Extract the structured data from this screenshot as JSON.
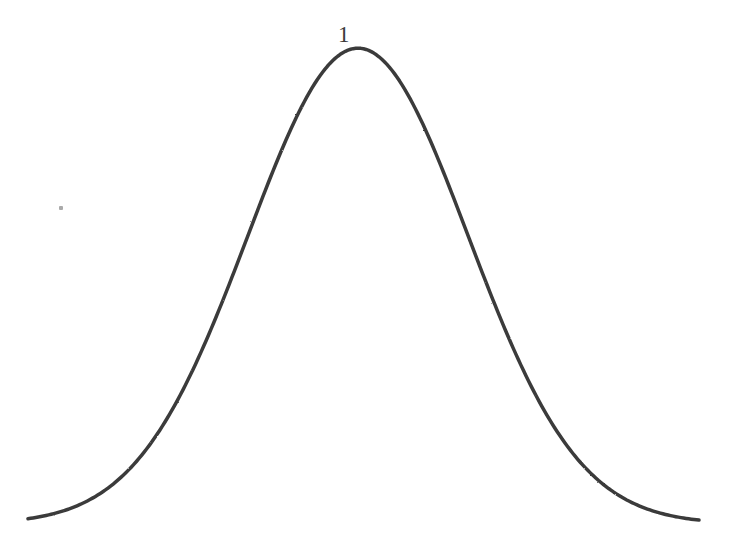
{
  "figure": {
    "type": "bell-curve-diagram",
    "background_color": "#ffffff",
    "ink_color": "#3b3b3b",
    "axis_color": "#555555",
    "peak_label": "1"
  },
  "chart_data": {
    "type": "line",
    "title": "",
    "subtitle": "",
    "xlabel": "",
    "ylabel": "",
    "legend": [],
    "legend_position": "none",
    "grid": false,
    "annotations": [
      {
        "name": "peak-height-label",
        "text": "1",
        "x": 0,
        "y": 1,
        "pixel_x": 345,
        "pixel_y": 37,
        "description": "value label marking the peak height of the curve"
      }
    ],
    "axes": {
      "x_axis_visible": true,
      "y_axis_visible": false,
      "x_axis_pixel_y": 524,
      "x_axis_pixel_x_start": 28,
      "x_axis_pixel_x_end": 712,
      "center_line_visible": true,
      "center_line_pixel_x": 358,
      "center_line_pixel_y_top": 28,
      "center_line_pixel_y_bottom": 524,
      "xlim": [
        -3.0,
        3.1
      ],
      "ylim": [
        0,
        1.05
      ],
      "x_ticks": [],
      "y_ticks": [
        1
      ]
    },
    "function": "gaussian",
    "peak_value": 1,
    "mean": 0,
    "sigma": 1,
    "x": [
      -3.0,
      -2.8,
      -2.6,
      -2.4,
      -2.2,
      -2.0,
      -1.8,
      -1.6,
      -1.4,
      -1.2,
      -1.0,
      -0.8,
      -0.6,
      -0.4,
      -0.2,
      0.0,
      0.2,
      0.4,
      0.6,
      0.8,
      1.0,
      1.2,
      1.4,
      1.6,
      1.8,
      2.0,
      2.2,
      2.4,
      2.6,
      2.8,
      3.0
    ],
    "values": [
      0.011,
      0.02,
      0.034,
      0.056,
      0.089,
      0.135,
      0.198,
      0.278,
      0.375,
      0.487,
      0.607,
      0.726,
      0.835,
      0.923,
      0.98,
      1.0,
      0.98,
      0.923,
      0.835,
      0.726,
      0.607,
      0.487,
      0.375,
      0.278,
      0.198,
      0.135,
      0.089,
      0.056,
      0.034,
      0.02,
      0.011
    ],
    "series": [
      {
        "name": "normal-distribution",
        "values": [
          0.011,
          0.02,
          0.034,
          0.056,
          0.089,
          0.135,
          0.198,
          0.278,
          0.375,
          0.487,
          0.607,
          0.726,
          0.835,
          0.923,
          0.98,
          1.0,
          0.98,
          0.923,
          0.835,
          0.726,
          0.607,
          0.487,
          0.375,
          0.278,
          0.198,
          0.135,
          0.089,
          0.056,
          0.034,
          0.02,
          0.011
        ]
      }
    ]
  },
  "artifacts": {
    "speck": {
      "name": "scan-speck",
      "pixel_x": 61,
      "pixel_y": 208
    }
  }
}
